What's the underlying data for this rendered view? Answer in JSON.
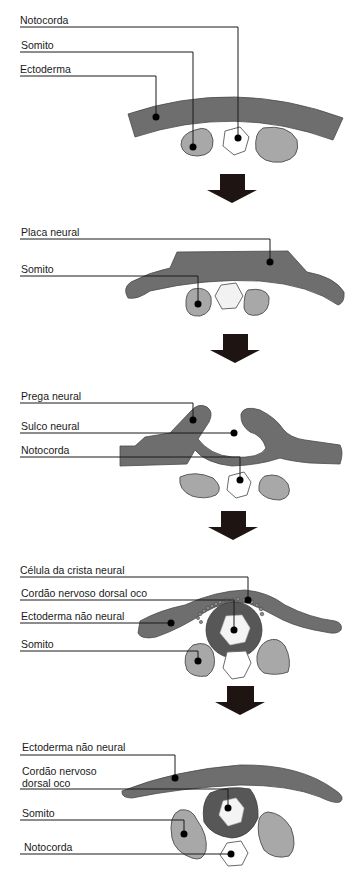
{
  "colors": {
    "ectoderm": "#6e6e6e",
    "somite": "#a8a8a8",
    "notochord": "#ffffff",
    "neural_tube": "#575757",
    "arrow": "#1e1412",
    "text": "#1a1a1a"
  },
  "stages": [
    {
      "labels": [
        {
          "text": "Notocorda",
          "target": "notochord"
        },
        {
          "text": "Somito",
          "target": "somite"
        },
        {
          "text": "Ectoderma",
          "target": "ectoderm"
        }
      ]
    },
    {
      "labels": [
        {
          "text": "Placa neural",
          "target": "neural-plate"
        },
        {
          "text": "Somito",
          "target": "somite"
        }
      ]
    },
    {
      "labels": [
        {
          "text": "Prega neural",
          "target": "neural-fold"
        },
        {
          "text": "Sulco neural",
          "target": "neural-groove"
        },
        {
          "text": "Notocorda",
          "target": "notochord"
        }
      ]
    },
    {
      "labels": [
        {
          "text": "Célula da crista neural",
          "target": "neural-crest-cell"
        },
        {
          "text": "Cordão nervoso dorsal oco",
          "target": "neural-tube"
        },
        {
          "text": "Ectoderma não neural",
          "target": "non-neural-ectoderm"
        },
        {
          "text": "Somito",
          "target": "somite"
        }
      ]
    },
    {
      "labels": [
        {
          "text": "Ectoderma não neural",
          "target": "non-neural-ectoderm"
        },
        {
          "text": "Cordão nervoso",
          "line2": "dorsal oco",
          "target": "neural-tube"
        },
        {
          "text": "Somito",
          "target": "somite"
        },
        {
          "text": "Notocorda",
          "target": "notochord"
        }
      ]
    }
  ],
  "arrows": [
    {
      "icon": "down-arrow-icon",
      "between": [
        1,
        2
      ]
    },
    {
      "icon": "down-arrow-icon",
      "between": [
        2,
        3
      ]
    },
    {
      "icon": "down-arrow-icon",
      "between": [
        3,
        4
      ]
    },
    {
      "icon": "down-arrow-icon",
      "between": [
        4,
        5
      ]
    }
  ]
}
